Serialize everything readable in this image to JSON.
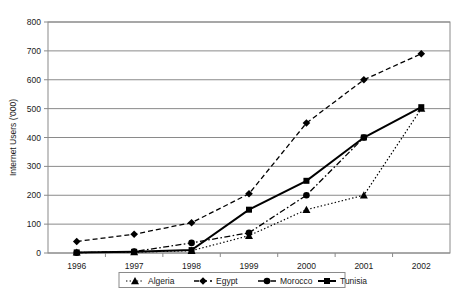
{
  "chart_data": {
    "type": "line",
    "title": "",
    "xlabel": "",
    "ylabel": "Internet Users ('000)",
    "categories": [
      "1996",
      "1997",
      "1998",
      "1999",
      "2000",
      "2001",
      "2002"
    ],
    "x": [
      1996,
      1997,
      1998,
      1999,
      2000,
      2001,
      2002
    ],
    "ylim": [
      0,
      800
    ],
    "yticks": [
      0,
      100,
      200,
      300,
      400,
      500,
      600,
      700,
      800
    ],
    "ytick_labels": [
      "0",
      "100",
      "200",
      "300",
      "400",
      "500",
      "600",
      "700",
      "800"
    ],
    "grid": "horizontal",
    "legend_position": "bottom",
    "series": [
      {
        "name": "Algeria",
        "marker": "triangle",
        "line_style": "dotted",
        "values": [
          2,
          3,
          8,
          60,
          150,
          200,
          500
        ]
      },
      {
        "name": "Egypt",
        "marker": "diamond",
        "line_style": "dashed",
        "values": [
          40,
          65,
          105,
          205,
          450,
          600,
          690
        ]
      },
      {
        "name": "Morocco",
        "marker": "circle",
        "line_style": "dash-dot",
        "values": [
          1,
          5,
          35,
          70,
          200,
          400,
          null
        ]
      },
      {
        "name": "Tunisia",
        "marker": "square",
        "line_style": "solid",
        "values": [
          2,
          4,
          10,
          150,
          250,
          400,
          505
        ]
      }
    ]
  },
  "axes": {
    "y_title": "Internet Users ('000)",
    "y_ticks": [
      "800",
      "700",
      "600",
      "500",
      "400",
      "300",
      "200",
      "100",
      "0"
    ],
    "x_ticks": [
      "1996",
      "1997",
      "1998",
      "1999",
      "2000",
      "2001",
      "2002"
    ]
  },
  "legend": {
    "items": [
      {
        "label": "Algeria",
        "style": "dotted-triangle"
      },
      {
        "label": "Egypt",
        "style": "dashed-diamond"
      },
      {
        "label": "Morocco",
        "style": "dashdot-circle"
      },
      {
        "label": "Tunisia",
        "style": "solid-square"
      }
    ]
  },
  "colors": {
    "series": "#000000",
    "grid": "#8a8a8a",
    "text": "#1a1a1a",
    "background": "#ffffff"
  }
}
